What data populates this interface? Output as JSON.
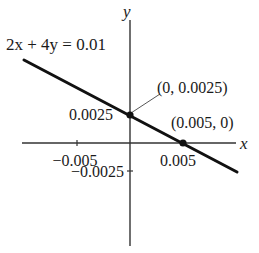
{
  "figure": {
    "equation_label": "2x + 4y = 0.01",
    "axes": {
      "x_label": "x",
      "y_label": "y",
      "x_ticks": [
        {
          "value": -0.005,
          "label": "−0.005"
        },
        {
          "value": 0.005,
          "label": "0.005"
        }
      ],
      "y_ticks": [
        {
          "value": 0.0025,
          "label": "0.0025"
        },
        {
          "value": -0.0025,
          "label": "−0.0025"
        }
      ]
    },
    "points": [
      {
        "label": "(0, 0.0025)",
        "x": 0,
        "y": 0.0025
      },
      {
        "label": "(0.005, 0)",
        "x": 0.005,
        "y": 0
      }
    ],
    "colors": {
      "line": "#111111",
      "axis": "#333333",
      "text": "#1a1a1a"
    }
  }
}
